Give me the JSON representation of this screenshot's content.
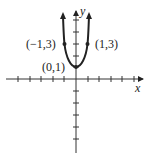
{
  "figure": {
    "type": "function-graph",
    "function": "y = 2x^2 + 1",
    "axes": {
      "x_label": "x",
      "y_label": "y",
      "origin_px": [
        76,
        79
      ],
      "unit_px": 11.6,
      "x_ticks": [
        -5,
        -4,
        -3,
        -2,
        -1,
        1,
        2,
        3,
        4,
        5
      ],
      "y_ticks": [
        -6,
        -5,
        -4,
        -3,
        -2,
        -1,
        1,
        2,
        3,
        4,
        5
      ]
    },
    "points": [
      {
        "label": "(−1,3)",
        "x": -1,
        "y": 3
      },
      {
        "label": "(0,1)",
        "x": 0,
        "y": 1
      },
      {
        "label": "(1,3)",
        "x": 1,
        "y": 3
      }
    ],
    "colors": {
      "ink": "#222222",
      "background": "#ffffff"
    }
  }
}
